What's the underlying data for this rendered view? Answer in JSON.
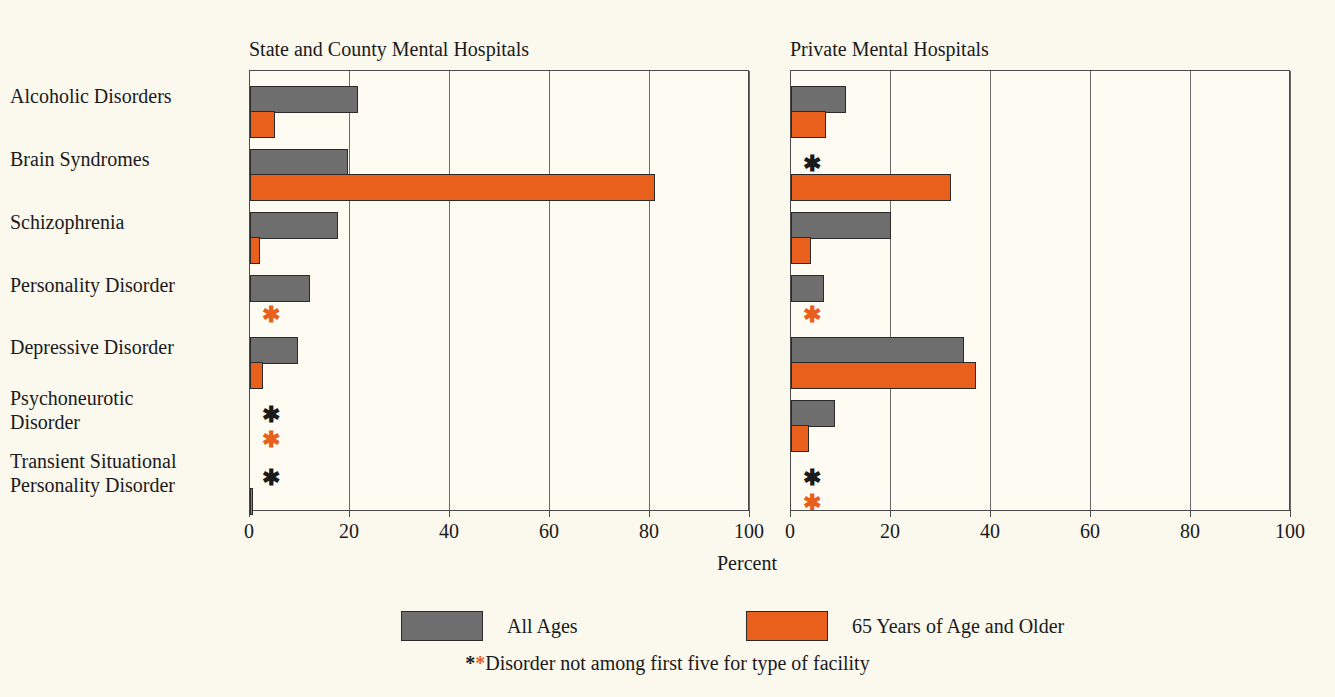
{
  "chart_data": {
    "type": "bar",
    "title": "",
    "orientation": "horizontal",
    "xlabel": "Percent",
    "ylabel": "",
    "xlim": [
      0,
      100
    ],
    "xticks": [
      0,
      20,
      40,
      60,
      80,
      100
    ],
    "grid": true,
    "legend_position": "bottom",
    "note": "Grouped horizontal bar chart with two panels; asterisk marks categories not among the first five for that type of facility.",
    "categories": [
      "Alcoholic Disorders",
      "Brain Syndromes",
      "Schizophrenia",
      "Personality Disorder",
      "Depressive Disorder",
      "Psychoneurotic\nDisorder",
      "Transient Situational\nPersonality Disorder"
    ],
    "series_names": [
      "All Ages",
      "65 Years of Age and Older"
    ],
    "panels": [
      {
        "title": "State and County Mental Hospitals",
        "series": [
          {
            "name": "All Ages",
            "color": "#6e6e6e",
            "values": [
              21.5,
              19.5,
              17.5,
              12.0,
              9.5,
              null,
              null
            ]
          },
          {
            "name": "65 Years of Age and Older",
            "color": "#e8601c",
            "values": [
              5.0,
              81.0,
              2.0,
              null,
              2.5,
              null,
              0.6
            ]
          }
        ]
      },
      {
        "title": "Private Mental Hospitals",
        "series": [
          {
            "name": "All Ages",
            "color": "#6e6e6e",
            "values": [
              11.0,
              null,
              20.0,
              6.5,
              34.5,
              8.8,
              null
            ]
          },
          {
            "name": "65 Years of Age and Older",
            "color": "#e8601c",
            "values": [
              7.0,
              32.0,
              4.0,
              null,
              37.0,
              3.5,
              null
            ]
          }
        ]
      }
    ]
  },
  "legend": {
    "items": [
      {
        "label": "All Ages",
        "color": "#6e6e6e",
        "swatch": "gray"
      },
      {
        "label": "65 Years of Age and Older",
        "color": "#e8601c",
        "swatch": "orange"
      }
    ],
    "footnote_marks": "**",
    "footnote": "Disorder not among first five for type of facility"
  },
  "axis": {
    "caption": "Percent",
    "tick_labels": [
      "0",
      "20",
      "40",
      "60",
      "80",
      "100"
    ]
  },
  "colors": {
    "background": "#fbf8ee",
    "plot_background": "#fdfbf2",
    "gray_series": "#6e6e6e",
    "orange_series": "#e8601c",
    "axis": "#4a4a4a",
    "text": "#1a1a1a"
  }
}
